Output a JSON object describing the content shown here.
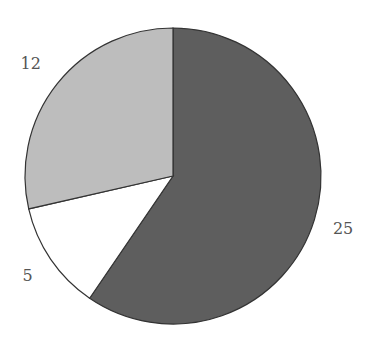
{
  "chart_data": {
    "type": "pie",
    "title": "",
    "start_angle_deg": -90,
    "direction": "clockwise",
    "slices": [
      {
        "label": "25",
        "value": 25,
        "color": "#5e5e5e"
      },
      {
        "label": "5",
        "value": 5,
        "color": "#ffffff"
      },
      {
        "label": "12",
        "value": 12,
        "color": "#bdbdbd"
      }
    ],
    "legend": "none",
    "data_labels_outside": true
  },
  "colors": {
    "edge": "#333333",
    "label_text": "#555555",
    "background": "#ffffff"
  }
}
